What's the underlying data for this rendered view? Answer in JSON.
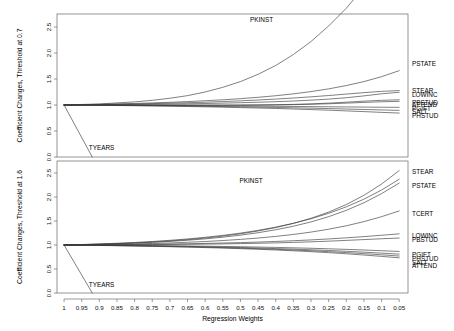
{
  "figure": {
    "name": "coefficient-change-diagnostic-plot",
    "background_color": "#ffffff",
    "line_color": "#3a3a3a",
    "frame_color": "#7a7a7a"
  },
  "xaxis": {
    "label": "Regression Weights",
    "ticks": [
      "1",
      "0.95",
      "0.9",
      "0.85",
      "0.8",
      "0.75",
      "0.7",
      "0.65",
      "0.6",
      "0.55",
      "0.5",
      "0.45",
      "0.4",
      "0.35",
      "0.3",
      "0.25",
      "0.2",
      "0.15",
      "0.1",
      "0.05"
    ],
    "values": [
      1,
      0.95,
      0.9,
      0.85,
      0.8,
      0.75,
      0.7,
      0.65,
      0.6,
      0.55,
      0.5,
      0.45,
      0.4,
      0.35,
      0.3,
      0.25,
      0.2,
      0.15,
      0.1,
      0.05
    ],
    "direction": "descending",
    "range": [
      1.0,
      0.03
    ]
  },
  "chart_data": [
    {
      "type": "line",
      "panel": "top",
      "title": "",
      "ylabel": "Coefficient Changes, Threshold at 0.7",
      "xlabel": "Regression Weights",
      "ylim": [
        0.0,
        2.75
      ],
      "yticks": [
        "0.0",
        "0.5",
        "1.0",
        "1.5",
        "2.0",
        "2.5"
      ],
      "ytickvalues": [
        0.0,
        0.5,
        1.0,
        1.5,
        2.0,
        2.5
      ],
      "x": [
        1.0,
        0.95,
        0.9,
        0.85,
        0.8,
        0.75,
        0.7,
        0.65,
        0.6,
        0.55,
        0.5,
        0.45,
        0.4,
        0.35,
        0.3,
        0.25,
        0.2,
        0.15,
        0.1,
        0.05
      ],
      "grid": false,
      "legend": "inline-right-labels",
      "series": [
        {
          "name": "PKINST",
          "label_x": 0.44,
          "label_y": 2.62,
          "values": [
            1.0,
            1.01,
            1.02,
            1.04,
            1.06,
            1.09,
            1.13,
            1.18,
            1.25,
            1.34,
            1.45,
            1.59,
            1.76,
            1.97,
            2.22,
            2.52,
            2.86,
            3.26,
            3.7,
            4.2
          ]
        },
        {
          "name": "PSTATE",
          "label_x": 0.055,
          "label_y": 1.78,
          "values": [
            1.0,
            1.006,
            1.013,
            1.021,
            1.03,
            1.04,
            1.052,
            1.066,
            1.082,
            1.1,
            1.122,
            1.148,
            1.178,
            1.214,
            1.258,
            1.31,
            1.374,
            1.45,
            1.545,
            1.66
          ]
        },
        {
          "name": "STEAR",
          "label_x": 0.055,
          "label_y": 1.27,
          "values": [
            1.0,
            1.004,
            1.009,
            1.014,
            1.02,
            1.027,
            1.035,
            1.044,
            1.054,
            1.066,
            1.08,
            1.096,
            1.114,
            1.134,
            1.157,
            1.182,
            1.21,
            1.238,
            1.262,
            1.278
          ]
        },
        {
          "name": "LOWINC",
          "label_x": 0.055,
          "label_y": 1.19,
          "values": [
            1.0,
            1.002,
            1.004,
            1.007,
            1.01,
            1.014,
            1.018,
            1.023,
            1.029,
            1.036,
            1.044,
            1.053,
            1.064,
            1.077,
            1.093,
            1.113,
            1.14,
            1.175,
            1.215,
            1.245
          ]
        },
        {
          "name": "PBSTUD",
          "label_x": 0.055,
          "label_y": 1.025,
          "values": [
            1.0,
            1.0,
            1.0,
            1.0,
            0.999,
            0.999,
            0.998,
            0.998,
            0.998,
            0.998,
            0.999,
            1.001,
            1.005,
            1.012,
            1.022,
            1.036,
            1.054,
            1.074,
            1.09,
            1.1
          ]
        },
        {
          "name": "ATTEND",
          "label_x": 0.055,
          "label_y": 1.0,
          "values": [
            1.0,
            0.999,
            0.999,
            0.998,
            0.997,
            0.997,
            0.996,
            0.996,
            0.996,
            0.996,
            0.997,
            0.999,
            1.002,
            1.007,
            1.014,
            1.024,
            1.036,
            1.05,
            1.062,
            1.07
          ]
        },
        {
          "name": "PGIFT",
          "label_x": 0.055,
          "label_y": 0.925,
          "values": [
            1.0,
            0.999,
            0.997,
            0.996,
            0.994,
            0.992,
            0.99,
            0.988,
            0.986,
            0.983,
            0.981,
            0.978,
            0.975,
            0.972,
            0.969,
            0.966,
            0.963,
            0.96,
            0.957,
            0.955
          ]
        },
        {
          "name": "SALT",
          "label_x": 0.055,
          "label_y": 0.865,
          "values": [
            1.0,
            0.998,
            0.996,
            0.993,
            0.99,
            0.987,
            0.983,
            0.979,
            0.975,
            0.97,
            0.965,
            0.959,
            0.953,
            0.946,
            0.939,
            0.931,
            0.923,
            0.914,
            0.905,
            0.897
          ]
        },
        {
          "name": "PHSTUD",
          "label_x": 0.055,
          "label_y": 0.79,
          "values": [
            1.0,
            0.997,
            0.994,
            0.99,
            0.986,
            0.982,
            0.977,
            0.971,
            0.965,
            0.958,
            0.95,
            0.942,
            0.933,
            0.923,
            0.912,
            0.9,
            0.887,
            0.873,
            0.858,
            0.845
          ]
        },
        {
          "name": "TYEARS",
          "label_x": 0.93,
          "label_y": 0.16,
          "values": [
            1.0,
            0.0,
            null,
            null,
            null,
            null,
            null,
            null,
            null,
            null,
            null,
            null,
            null,
            null,
            null,
            null,
            null,
            null,
            null,
            null
          ]
        }
      ]
    },
    {
      "type": "line",
      "panel": "bottom",
      "title": "",
      "ylabel": "Coefficient Changes, Threshold at 1.6",
      "xlabel": "Regression Weights",
      "ylim": [
        0.0,
        2.75
      ],
      "yticks": [
        "0.0",
        "0.5",
        "1.0",
        "1.5",
        "2.0",
        "2.5"
      ],
      "ytickvalues": [
        0.0,
        0.5,
        1.0,
        1.5,
        2.0,
        2.5
      ],
      "x": [
        1.0,
        0.95,
        0.9,
        0.85,
        0.8,
        0.75,
        0.7,
        0.65,
        0.6,
        0.55,
        0.5,
        0.45,
        0.4,
        0.35,
        0.3,
        0.25,
        0.2,
        0.15,
        0.1,
        0.05
      ],
      "grid": false,
      "legend": "inline-right-labels",
      "series": [
        {
          "name": "PKINST",
          "label_x": 0.47,
          "label_y": 2.33,
          "values": [
            1.0,
            1.01,
            1.022,
            1.036,
            1.053,
            1.073,
            1.097,
            1.126,
            1.16,
            1.2,
            1.248,
            1.305,
            1.372,
            1.452,
            1.547,
            1.66,
            1.795,
            1.955,
            2.145,
            2.37
          ]
        },
        {
          "name": "STEAR",
          "label_x": 0.055,
          "label_y": 2.52,
          "values": [
            1.0,
            1.008,
            1.018,
            1.03,
            1.045,
            1.063,
            1.085,
            1.112,
            1.145,
            1.185,
            1.233,
            1.292,
            1.363,
            1.45,
            1.556,
            1.685,
            1.843,
            2.035,
            2.27,
            2.55
          ]
        },
        {
          "name": "PSTATE",
          "label_x": 0.055,
          "label_y": 2.22,
          "values": [
            1.0,
            1.007,
            1.015,
            1.026,
            1.039,
            1.055,
            1.075,
            1.099,
            1.128,
            1.163,
            1.205,
            1.256,
            1.317,
            1.391,
            1.481,
            1.59,
            1.722,
            1.88,
            2.07,
            2.29
          ]
        },
        {
          "name": "TCERT",
          "label_x": 0.055,
          "label_y": 1.64,
          "values": [
            1.0,
            1.004,
            1.009,
            1.015,
            1.023,
            1.032,
            1.043,
            1.057,
            1.073,
            1.093,
            1.117,
            1.145,
            1.179,
            1.22,
            1.269,
            1.329,
            1.4,
            1.487,
            1.59,
            1.71
          ]
        },
        {
          "name": "LOWINC",
          "label_x": 0.055,
          "label_y": 1.19,
          "values": [
            1.0,
            1.002,
            1.004,
            1.007,
            1.011,
            1.015,
            1.02,
            1.026,
            1.033,
            1.041,
            1.05,
            1.061,
            1.074,
            1.089,
            1.106,
            1.126,
            1.149,
            1.175,
            1.203,
            1.232
          ]
        },
        {
          "name": "PBSTUD",
          "label_x": 0.055,
          "label_y": 1.1,
          "values": [
            1.0,
            1.001,
            1.002,
            1.004,
            1.006,
            1.008,
            1.011,
            1.014,
            1.018,
            1.023,
            1.029,
            1.036,
            1.044,
            1.054,
            1.066,
            1.08,
            1.096,
            1.113,
            1.13,
            1.145
          ]
        },
        {
          "name": "PGIFT",
          "label_x": 0.055,
          "label_y": 0.79,
          "values": [
            1.0,
            0.998,
            0.996,
            0.994,
            0.991,
            0.988,
            0.984,
            0.98,
            0.975,
            0.97,
            0.964,
            0.957,
            0.95,
            0.941,
            0.932,
            0.921,
            0.909,
            0.896,
            0.881,
            0.865
          ]
        },
        {
          "name": "PHSTUD",
          "label_x": 0.055,
          "label_y": 0.7,
          "values": [
            1.0,
            0.997,
            0.994,
            0.99,
            0.986,
            0.981,
            0.976,
            0.97,
            0.963,
            0.955,
            0.947,
            0.937,
            0.926,
            0.914,
            0.901,
            0.886,
            0.869,
            0.851,
            0.831,
            0.81
          ]
        },
        {
          "name": "SALT",
          "label_x": 0.055,
          "label_y": 0.61,
          "values": [
            1.0,
            0.996,
            0.992,
            0.987,
            0.982,
            0.976,
            0.969,
            0.962,
            0.954,
            0.945,
            0.935,
            0.923,
            0.91,
            0.896,
            0.88,
            0.862,
            0.842,
            0.82,
            0.796,
            0.77
          ]
        },
        {
          "name": "ATTEND",
          "label_x": 0.055,
          "label_y": 0.55,
          "values": [
            1.0,
            0.995,
            0.99,
            0.985,
            0.979,
            0.972,
            0.964,
            0.956,
            0.946,
            0.936,
            0.924,
            0.911,
            0.896,
            0.879,
            0.861,
            0.84,
            0.817,
            0.791,
            0.763,
            0.733
          ]
        },
        {
          "name": "TYEARS",
          "label_x": 0.93,
          "label_y": 0.16,
          "values": [
            1.0,
            0.0,
            null,
            null,
            null,
            null,
            null,
            null,
            null,
            null,
            null,
            null,
            null,
            null,
            null,
            null,
            null,
            null,
            null,
            null
          ]
        }
      ]
    }
  ]
}
